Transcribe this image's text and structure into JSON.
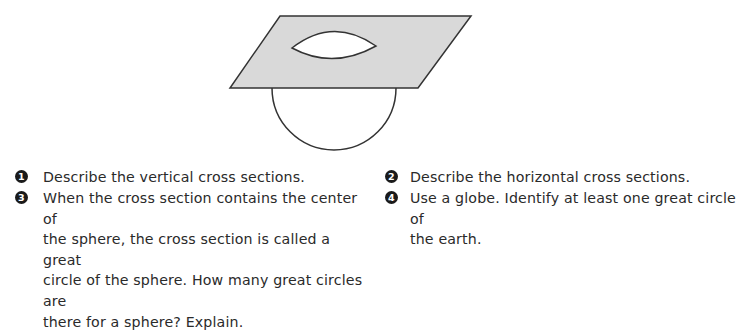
{
  "figure": {
    "plane_fill": "#d9d9d9",
    "stroke": "#333333"
  },
  "questions": [
    {
      "number": "1",
      "text": "Describe the vertical cross sections."
    },
    {
      "number": "2",
      "text": "Describe the horizontal cross sections."
    },
    {
      "number": "3",
      "text": "When the cross section contains the center of\nthe sphere, the cross section is called a great\ncircle of the sphere. How many great circles are\nthere for a sphere? Explain."
    },
    {
      "number": "4",
      "text": "Use a globe. Identify at least one great circle of\nthe earth."
    }
  ]
}
